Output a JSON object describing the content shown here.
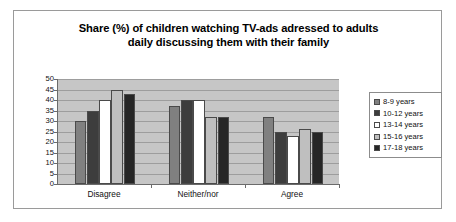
{
  "chart_data": {
    "type": "bar",
    "title": "Share (%) of children watching TV-ads adressed to adults daily discussing them with their family",
    "title_lines": [
      "Share (%) of children watching TV-ads adressed to adults",
      "daily discussing them with their family"
    ],
    "xlabel": "",
    "ylabel": "",
    "ylim": [
      0,
      50
    ],
    "ytick_step": 5,
    "yticks": [
      50,
      45,
      40,
      35,
      30,
      25,
      20,
      15,
      10,
      5,
      0
    ],
    "grid": true,
    "legend_position": "right",
    "categories": [
      "Disagree",
      "Neither/nor",
      "Agree"
    ],
    "series": [
      {
        "name": "8-9 years",
        "color": "#808080",
        "values": [
          30,
          37,
          32
        ]
      },
      {
        "name": "10-12 years",
        "color": "#3d3d3d",
        "values": [
          35,
          40,
          25
        ]
      },
      {
        "name": "13-14 years",
        "color": "#ffffff",
        "values": [
          40,
          40,
          23
        ]
      },
      {
        "name": "15-16 years",
        "color": "#bfbfbf",
        "values": [
          45,
          32,
          26
        ]
      },
      {
        "name": "17-18 years",
        "color": "#262626",
        "values": [
          43,
          32,
          25
        ]
      }
    ],
    "plot_background": "#c6c6c6",
    "page_background": "#ffffff"
  }
}
